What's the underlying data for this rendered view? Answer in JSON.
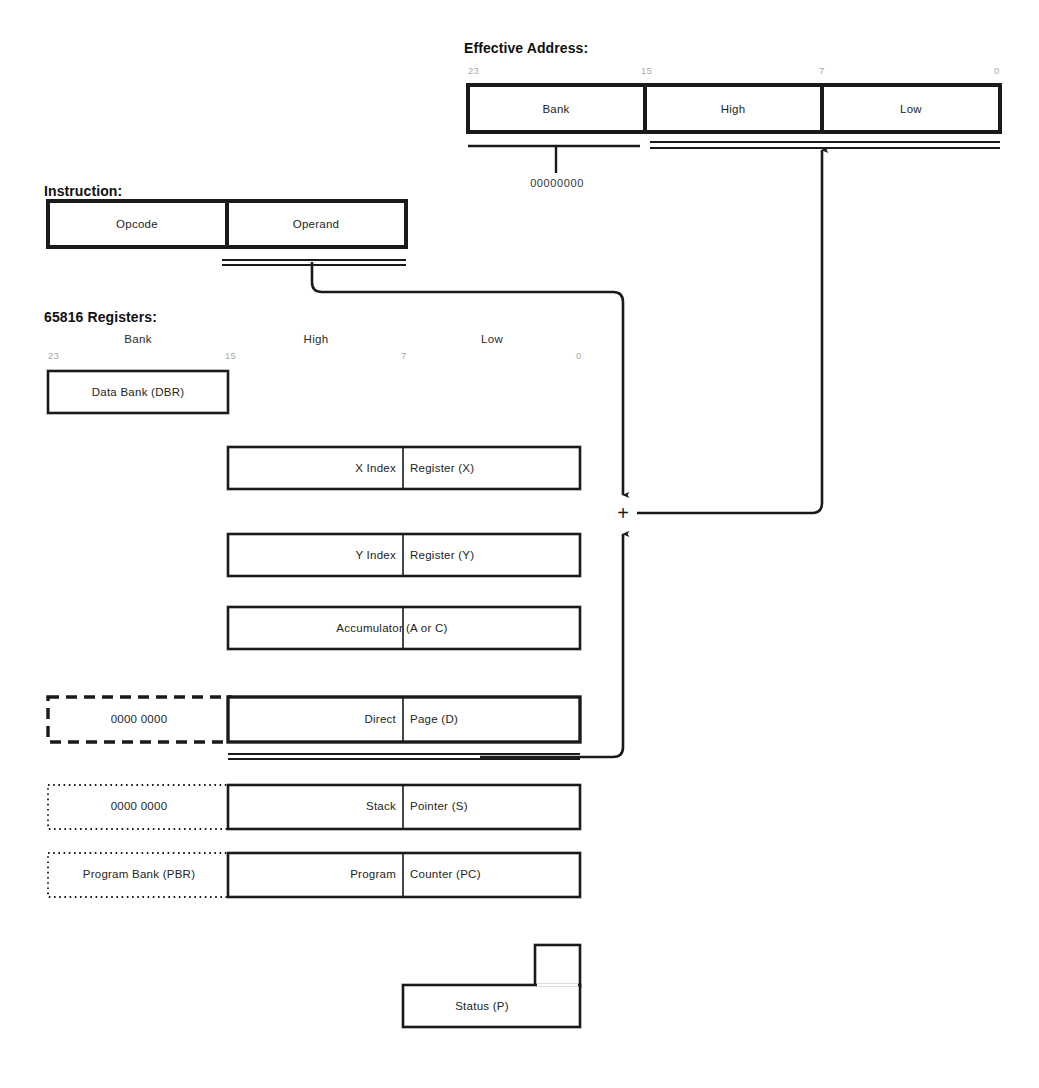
{
  "diagram": {
    "ink_color": "#1a1a1a",
    "background_color": "#ffffff"
  },
  "effective_address": {
    "heading": "Effective Address:",
    "bit_labels": [
      "23",
      "15",
      "7",
      "0"
    ],
    "fields": [
      {
        "label": "Bank"
      },
      {
        "label": "High"
      },
      {
        "label": "Low"
      }
    ],
    "bank_annotation": "00000000"
  },
  "instruction": {
    "heading": "Instruction:",
    "fields": [
      {
        "label": "Opcode"
      },
      {
        "label": "Operand"
      }
    ]
  },
  "registers": {
    "heading": "65816 Registers:",
    "column_headings": [
      "Bank",
      "High",
      "Low"
    ],
    "bit_labels": [
      "23",
      "15",
      "7",
      "0"
    ],
    "rows": [
      {
        "name": "data-bank-register",
        "left_box": null,
        "main_box": {
          "left_text": "",
          "right_text": "Data Bank (DBR)",
          "split": false
        }
      },
      {
        "name": "x-index-register",
        "left_box": null,
        "main_box": {
          "left_text": "X Index",
          "right_text": "Register (X)",
          "split": true
        }
      },
      {
        "name": "y-index-register",
        "left_box": null,
        "main_box": {
          "left_text": "Y Index",
          "right_text": "Register (Y)",
          "split": true
        }
      },
      {
        "name": "accumulator-register",
        "left_box": null,
        "main_box": {
          "left_text": "Accumulator",
          "right_text": "(A or C)",
          "split": true
        }
      },
      {
        "name": "direct-page-register",
        "left_box": {
          "text": "0000 0000",
          "border": "dashed"
        },
        "main_box": {
          "left_text": "Direct",
          "right_text": "Page (D)",
          "split": true
        }
      },
      {
        "name": "stack-pointer-register",
        "left_box": {
          "text": "0000 0000",
          "border": "dotted"
        },
        "main_box": {
          "left_text": "Stack",
          "right_text": "Pointer (S)",
          "split": true
        }
      },
      {
        "name": "program-counter-register",
        "left_box": {
          "text": "Program Bank (PBR)",
          "border": "dotted"
        },
        "main_box": {
          "left_text": "Program",
          "right_text": "Counter (PC)",
          "split": true
        }
      },
      {
        "name": "status-register",
        "left_box": null,
        "main_box": {
          "left_text": "Status (P)",
          "right_text": "",
          "split": false
        }
      }
    ]
  },
  "adder": {
    "symbol": "+"
  }
}
